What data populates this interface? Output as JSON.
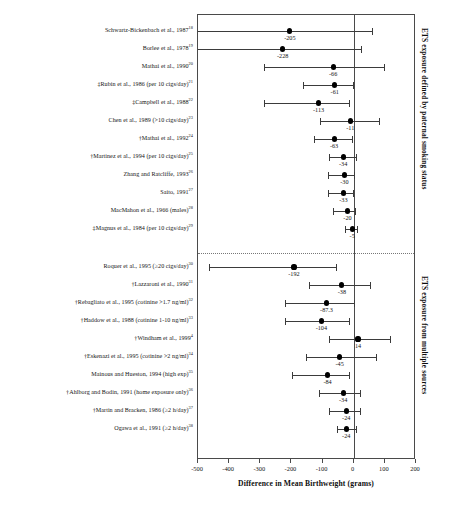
{
  "chart_data": {
    "type": "scatter",
    "title": "",
    "xlabel": "Difference in Mean Birthweight (grams)",
    "ylabel": "",
    "xlim": [
      -500,
      200
    ],
    "xticks": [
      -500,
      -400,
      -300,
      -200,
      -100,
      0,
      100,
      200
    ],
    "xtick_labels": [
      "-500",
      "-400",
      "-300",
      "-200",
      "-100",
      "0",
      "100",
      "200"
    ],
    "grid": false,
    "legend": "none",
    "reference_line": 0,
    "groups": [
      {
        "caption": "ETS exposure defined by paternal smoking status",
        "studies": [
          {
            "label": "Schwartz-Bickenbach et al., 1987",
            "ref": "18",
            "value": -205,
            "value_label": "-205",
            "low": -560,
            "high": 60,
            "low_clipped": true
          },
          {
            "label": "Borlee et al., 1978",
            "ref": "19",
            "value": -228,
            "value_label": "-228",
            "low": -555,
            "high": 22,
            "low_clipped": true
          },
          {
            "label": "Mathai et al., 1990",
            "ref": "20",
            "value": -66,
            "value_label": "-66",
            "low": -289,
            "high": 98,
            "low_clipped": false
          },
          {
            "label": "‡Rubin et al., 1986 (per 10 cigs/day)",
            "ref": "21",
            "value": -61,
            "value_label": "-61",
            "low": -163,
            "high": -1,
            "low_clipped": false
          },
          {
            "label": "‡Campbell et al., 1988",
            "ref": "22",
            "value": -113,
            "value_label": "-113",
            "low": -289,
            "high": -14,
            "low_clipped": false
          },
          {
            "label": "Chen et al., 1989 (>10 cigs/day)",
            "ref": "23",
            "value": -11,
            "value_label": "-11",
            "low": -107,
            "high": 80,
            "low_clipped": false
          },
          {
            "label": "†Mathai et al., 1992",
            "ref": "24",
            "value": -63,
            "value_label": "-63",
            "low": -128,
            "high": -6,
            "low_clipped": false
          },
          {
            "label": "†Martinez et al., 1994 (per 10 cigs/day)",
            "ref": "25",
            "value": -34,
            "value_label": "-34",
            "low": -79,
            "high": 8,
            "low_clipped": false
          },
          {
            "label": "Zhang and Ratcliffe, 1993",
            "ref": "26",
            "value": -30,
            "value_label": "-30",
            "low": -83,
            "high": 2,
            "low_clipped": false
          },
          {
            "label": "Saito, 1991",
            "ref": "27",
            "value": -33,
            "value_label": "-33",
            "low": -82,
            "high": -2,
            "low_clipped": false
          },
          {
            "label": "MacMahon et al., 1966 (males)",
            "ref": "28",
            "value": -20,
            "value_label": "-20",
            "low": -65,
            "high": 3,
            "low_clipped": false
          },
          {
            "label": "‡Magnus et al., 1984 (per 10 cigs/day)",
            "ref": "29",
            "value": -5,
            "value_label": "-5",
            "low": -28,
            "high": 12,
            "low_clipped": false
          }
        ]
      },
      {
        "caption": "ETS exposure from multiple sources",
        "studies": [
          {
            "label": "Roquer et al., 1995 (≥20 cigs/day)",
            "ref": "30",
            "value": -192,
            "value_label": "-192",
            "low": -466,
            "high": -58,
            "low_clipped": false
          },
          {
            "label": "†Lazzaroni et al., 1990",
            "ref": "31",
            "value": -38,
            "value_label": "-38",
            "low": -142,
            "high": 52,
            "low_clipped": false
          },
          {
            "label": "†Rebagliato et al., 1995 (cotinine >1.7 ng/ml)",
            "ref": "32",
            "value": -87.3,
            "value_label": "-87.3",
            "low": -220,
            "high": 1,
            "low_clipped": false
          },
          {
            "label": "†Haddow et al., 1988 (cotinine 1-10 ng/ml)",
            "ref": "33",
            "value": -104,
            "value_label": "-104",
            "low": -220,
            "high": -15,
            "low_clipped": false
          },
          {
            "label": "†Windham et al., 1999",
            "ref": "4",
            "value": 14,
            "value_label": "14",
            "low": -80,
            "high": 115,
            "low_clipped": false
          },
          {
            "label": "†Eskenazi et al., 1995 (cotinine >2 ng/ml)",
            "ref": "34",
            "value": -45,
            "value_label": "-45",
            "low": -152,
            "high": 72,
            "low_clipped": false
          },
          {
            "label": "Mainous and Hueston, 1994 (high exp)",
            "ref": "35",
            "value": -84,
            "value_label": "-84",
            "low": -199,
            "high": -15,
            "low_clipped": false
          },
          {
            "label": "†Ahlborg and Bodin, 1991 (home exposure only)",
            "ref": "36",
            "value": -34,
            "value_label": "-34",
            "low": -112,
            "high": 21,
            "low_clipped": false
          },
          {
            "label": "†Martin and Bracken, 1986 (≥2 h/day)",
            "ref": "37",
            "value": -24,
            "value_label": "-24",
            "low": -78,
            "high": 20,
            "low_clipped": false
          },
          {
            "label": "Ogawa et al., 1991 (≥2 h/day)",
            "ref": "38",
            "value": -24,
            "value_label": "-24",
            "low": -55,
            "high": 8,
            "low_clipped": false
          }
        ]
      }
    ]
  }
}
